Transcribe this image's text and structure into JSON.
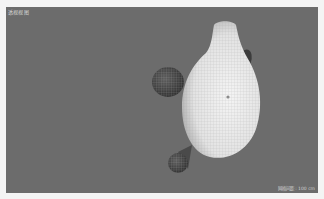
{
  "viewport": {
    "label": "透视视图",
    "status": "网格间距 : 100 cm",
    "background_color": "#6c6c6c"
  },
  "scene": {
    "objects": [
      {
        "name": "main-body",
        "description": "white oval body with neck, wireframe mesh"
      },
      {
        "name": "left-sphere",
        "description": "dark wireframe sphere on left"
      },
      {
        "name": "right-fin",
        "description": "small dark lobe on upper right"
      },
      {
        "name": "bottom-sphere",
        "description": "small wireframe sphere lower left"
      }
    ]
  }
}
